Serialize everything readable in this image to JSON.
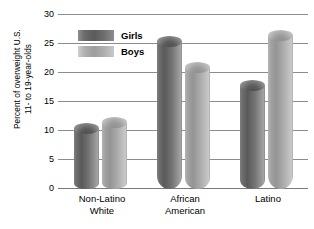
{
  "chart_data": {
    "type": "bar",
    "title": "",
    "subtitle": "",
    "xlabel": "",
    "ylabel": "Percent of overweight U.S. 11- to 19-year-olds",
    "ylabel_lines": [
      "Percent of overweight U.S.",
      "11- to 19-year-olds"
    ],
    "categories": [
      "Non-Latino White",
      "African American",
      "Latino"
    ],
    "category_lines": [
      [
        "Non-Latino",
        "White"
      ],
      [
        "African",
        "American"
      ],
      [
        "Latino"
      ]
    ],
    "series": [
      {
        "name": "Girls",
        "values": [
          10.5,
          25.5,
          17.8
        ],
        "color": "#5b5b5b"
      },
      {
        "name": "Boys",
        "values": [
          11.5,
          21.0,
          26.5
        ],
        "color": "#9d9d9d"
      }
    ],
    "ylim": [
      0,
      30
    ],
    "yticks": [
      30,
      25,
      20,
      15,
      10,
      5,
      0
    ],
    "ytick_labels": [
      "30",
      "25",
      "20",
      "15",
      "10",
      "5",
      "0"
    ],
    "grid": true,
    "legend_position": "upper-left-inside",
    "legend_entries": [
      "Girls",
      "Boys"
    ]
  },
  "legend": {
    "girls_label": "Girls",
    "boys_label": "Boys"
  },
  "axis": {
    "y_title_line1": "Percent of overweight U.S.",
    "y_title_line2": "11- to 19-year-olds",
    "tick_30": "30",
    "tick_25": "25",
    "tick_20": "20",
    "tick_15": "15",
    "tick_10": "10",
    "tick_5": "5",
    "tick_0": "0"
  },
  "categories": {
    "c0_line1": "Non-Latino",
    "c0_line2": "White",
    "c1_line1": "African",
    "c1_line2": "American",
    "c2_line1": "Latino"
  }
}
